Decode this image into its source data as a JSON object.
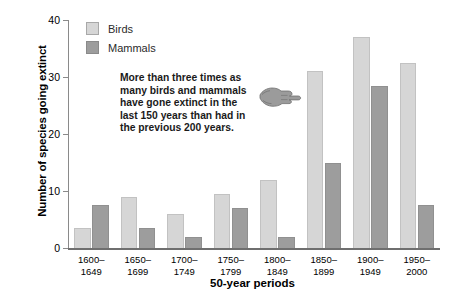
{
  "chart_data": {
    "type": "bar",
    "title": "",
    "xlabel": "50-year periods",
    "ylabel": "Number of species going extinct",
    "ylim": [
      0,
      40
    ],
    "yticks": [
      0,
      10,
      20,
      30,
      40
    ],
    "grid": false,
    "legend_position": "top-left",
    "categories": [
      "1600–\n1649",
      "1650–\n1699",
      "1700–\n1749",
      "1750–\n1799",
      "1800–\n1849",
      "1850–\n1899",
      "1900–\n1949",
      "1950–\n2000"
    ],
    "category_lines": [
      [
        "1600–",
        "1649"
      ],
      [
        "1650–",
        "1699"
      ],
      [
        "1700–",
        "1749"
      ],
      [
        "1750–",
        "1799"
      ],
      [
        "1800–",
        "1849"
      ],
      [
        "1850–",
        "1899"
      ],
      [
        "1900–",
        "1949"
      ],
      [
        "1950–",
        "2000"
      ]
    ],
    "series": [
      {
        "name": "Birds",
        "color": "#d6d6d6",
        "values": [
          3.5,
          9,
          6,
          9.5,
          12,
          31,
          37,
          32.5
        ]
      },
      {
        "name": "Mammals",
        "color": "#9d9d9d",
        "values": [
          7.5,
          3.5,
          2,
          7,
          2,
          15,
          28.5,
          7.5
        ]
      }
    ],
    "annotations": [
      {
        "name": "callout",
        "lines": [
          "More than three times as",
          "many birds and mammals",
          "have gone extinct in the",
          "last 150 years than had in",
          "the previous 200 years."
        ],
        "icon": "pointing-hand-icon"
      }
    ]
  },
  "legend": {
    "items": [
      {
        "label": "Birds",
        "swatch": "birds-swatch"
      },
      {
        "label": "Mammals",
        "swatch": "mammals-swatch"
      }
    ]
  },
  "axes": {
    "y_title": "Number of species going extinct",
    "x_title": "50-year periods",
    "y_tick_labels": [
      "40",
      "30",
      "20",
      "10",
      "0"
    ]
  }
}
